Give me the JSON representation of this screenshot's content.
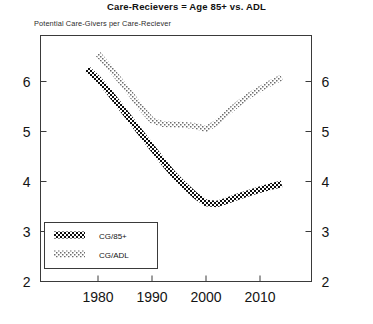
{
  "chart_data": {
    "type": "line",
    "title": "Care-Recievers = Age 85+ vs. ADL",
    "subtitle": "Potential Care-Givers per Care-Reciever",
    "xlabel": "",
    "ylabel": "",
    "xlim": [
      1976,
      2016
    ],
    "ylim": [
      2,
      6.8
    ],
    "xticks": [
      1980,
      1990,
      2000,
      2010
    ],
    "xtick_labels": [
      "1980",
      "1990",
      "2000",
      "2010"
    ],
    "yticks": [
      2,
      3,
      4,
      5,
      6
    ],
    "ytick_labels": [
      "2",
      "3",
      "4",
      "5",
      "6"
    ],
    "right_axis_ticks": [
      2,
      3,
      4,
      5,
      6
    ],
    "right_axis_tick_labels": [
      "2",
      "3",
      "4",
      "5",
      "6"
    ],
    "grid": false,
    "legend_position": "lower-left-inside",
    "marker_style": "checkered-dotted",
    "series": [
      {
        "name": "CG/85+",
        "fill": "solid-dark",
        "color": "#111111",
        "x": [
          1978,
          1980,
          1982,
          1984,
          1986,
          1988,
          1990,
          1992,
          1994,
          1996,
          1998,
          2000,
          2002,
          2004,
          2006,
          2008,
          2010,
          2012,
          2014
        ],
        "values": [
          6.25,
          6.05,
          5.8,
          5.52,
          5.24,
          4.96,
          4.68,
          4.4,
          4.14,
          3.92,
          3.72,
          3.57,
          3.55,
          3.62,
          3.7,
          3.77,
          3.84,
          3.9,
          3.95
        ]
      },
      {
        "name": "CG/ADL",
        "fill": "hollow-light",
        "color": "#8a8a8a",
        "x": [
          1980,
          1982,
          1984,
          1986,
          1988,
          1990,
          1992,
          1994,
          1996,
          1998,
          2000,
          2002,
          2004,
          2006,
          2008,
          2010,
          2012,
          2014
        ],
        "values": [
          6.55,
          6.3,
          6.03,
          5.76,
          5.47,
          5.22,
          5.15,
          5.14,
          5.13,
          5.11,
          5.05,
          5.18,
          5.38,
          5.56,
          5.72,
          5.85,
          5.97,
          6.08
        ]
      }
    ],
    "legend": [
      {
        "label": "CG/85+",
        "swatch": "solid-dark"
      },
      {
        "label": "CG/ADL",
        "swatch": "hollow-light"
      }
    ]
  }
}
